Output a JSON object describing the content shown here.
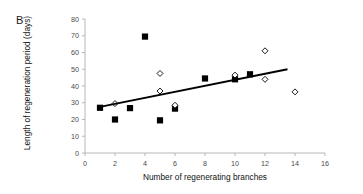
{
  "panel": {
    "label": "B"
  },
  "chart_data": {
    "type": "scatter",
    "title": "",
    "xlabel": "Number of regenerating branches",
    "ylabel": "Length of regeneration period (days)",
    "xlim": [
      0,
      16
    ],
    "ylim": [
      0,
      80
    ],
    "xticks": [
      0,
      2,
      4,
      6,
      8,
      10,
      12,
      14,
      16
    ],
    "yticks": [
      0,
      10,
      20,
      30,
      40,
      50,
      60,
      70,
      80
    ],
    "grid": false,
    "legend": "none",
    "series": [
      {
        "name": "filled-square",
        "marker": "filled-square",
        "color": "#000000",
        "points": [
          [
            1,
            27.0
          ],
          [
            2,
            20.0
          ],
          [
            3,
            26.8
          ],
          [
            4,
            69.5
          ],
          [
            5,
            19.5
          ],
          [
            6,
            26.5
          ],
          [
            8,
            44.5
          ],
          [
            10,
            44.0
          ],
          [
            11,
            47.0
          ]
        ]
      },
      {
        "name": "open-diamond",
        "marker": "open-diamond",
        "color": "#000000",
        "points": [
          [
            2,
            29.5
          ],
          [
            5,
            47.5
          ],
          [
            5,
            37.0
          ],
          [
            6,
            28.5
          ],
          [
            10,
            46.5
          ],
          [
            12,
            61.0
          ],
          [
            12,
            44.0
          ],
          [
            14,
            36.5
          ]
        ]
      }
    ],
    "trendline": {
      "name": "linear-fit",
      "x_start": 1.0,
      "y_start": 27.5,
      "x_end": 13.5,
      "y_end": 50.0,
      "color": "#000000"
    }
  }
}
